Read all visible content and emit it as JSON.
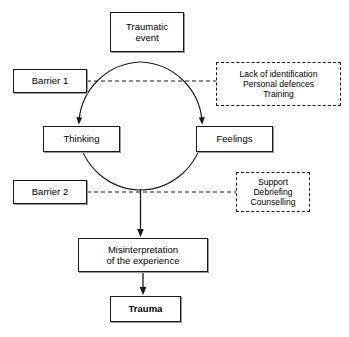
{
  "diagram": {
    "colors": {
      "background": "#ffffff",
      "stroke": "#1a1a1a",
      "text": "#000000",
      "shadow": "#9a9a9a"
    },
    "nodes": {
      "traumatic_event": {
        "line1": "Traumatic",
        "line2": "event"
      },
      "barrier_1": {
        "label": "Barrier 1"
      },
      "barrier_2": {
        "label": "Barrier 2"
      },
      "thinking": {
        "label": "Thinking"
      },
      "feelings": {
        "label": "Feelings"
      },
      "misinterpretation": {
        "line1": "Misinterpretation",
        "line2": "of the experience"
      },
      "trauma": {
        "label": "Trauma"
      },
      "barrier_1_detail": {
        "line1": "Lack of identification",
        "line2": "Personal defences",
        "line3": "Training"
      },
      "barrier_2_detail": {
        "line1": "Support",
        "line2": "Debriefing",
        "line3": "Counselling"
      }
    },
    "connectors": {
      "event_to_cycle": "Traumatic event feeds the cycle",
      "cycle_to_thinking": "arrow into Thinking",
      "cycle_to_feelings": "arrow into Feelings",
      "cycle_to_misinterpretation": "arrow into Misinterpretation of the experience",
      "misinterpretation_to_trauma": "arrow into Trauma",
      "barrier_1_link": "dashed link Barrier 1 to its detail box",
      "barrier_2_link": "dashed link Barrier 2 to its detail box"
    }
  }
}
